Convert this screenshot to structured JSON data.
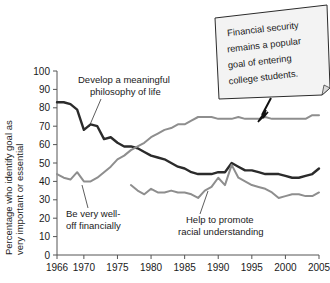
{
  "chart_data": {
    "type": "line",
    "title": "",
    "xlabel": "",
    "ylabel": "Percentage who identify goal as very important or essential",
    "xlim": [
      1966,
      2005
    ],
    "ylim": [
      0,
      100
    ],
    "grid": false,
    "legend_position": "inline-annotations",
    "xticks": [
      "1966",
      "1970",
      "1975",
      "1980",
      "1985",
      "1990",
      "1995",
      "2000",
      "2005"
    ],
    "xtick_values": [
      1966,
      1970,
      1975,
      1980,
      1985,
      1990,
      1995,
      2000,
      2005
    ],
    "yticks": [
      "0",
      "10",
      "20",
      "30",
      "40",
      "50",
      "60",
      "70",
      "80",
      "90",
      "100"
    ],
    "ytick_values": [
      0,
      10,
      20,
      30,
      40,
      50,
      60,
      70,
      80,
      90,
      100
    ],
    "annotations": [
      {
        "id": "callout",
        "text": "Financial security remains a popular goal of entering college students.",
        "lines": [
          "Financial security",
          "remains a popular",
          "goal of entering",
          "college students."
        ],
        "style": "sticky-note-with-arrow"
      }
    ],
    "series": [
      {
        "name": "Develop a meaningful philosophy of life",
        "label_lines": [
          "Develop a meaningful",
          "philosophy of life"
        ],
        "color": "#2b2b2b",
        "x": [
          1966,
          1967,
          1968,
          1969,
          1970,
          1971,
          1972,
          1973,
          1974,
          1975,
          1976,
          1977,
          1978,
          1979,
          1980,
          1981,
          1982,
          1983,
          1984,
          1985,
          1986,
          1987,
          1988,
          1989,
          1990,
          1991,
          1992,
          1993,
          1994,
          1995,
          1996,
          1997,
          1998,
          1999,
          2000,
          2001,
          2002,
          2003,
          2004,
          2005
        ],
        "values": [
          83,
          83,
          82,
          79,
          68,
          71,
          70,
          63,
          64,
          61,
          59,
          59,
          58,
          56,
          54,
          53,
          52,
          50,
          48,
          47,
          45,
          44,
          44,
          44,
          45,
          45,
          50,
          48,
          46,
          46,
          45,
          44,
          44,
          44,
          43,
          42,
          42,
          43,
          44,
          47
        ]
      },
      {
        "name": "Be very well-off financially",
        "label_lines": [
          "Be very well-",
          "off financially"
        ],
        "color": "#8e8e8e",
        "x": [
          1966,
          1967,
          1968,
          1969,
          1970,
          1971,
          1972,
          1973,
          1974,
          1975,
          1976,
          1977,
          1978,
          1979,
          1980,
          1981,
          1982,
          1983,
          1984,
          1985,
          1986,
          1987,
          1988,
          1989,
          1990,
          1991,
          1992,
          1993,
          1994,
          1995,
          1996,
          1997,
          1998,
          1999,
          2000,
          2001,
          2002,
          2003,
          2004,
          2005
        ],
        "values": [
          44,
          42,
          41,
          45,
          40,
          40,
          42,
          45,
          48,
          52,
          54,
          57,
          59,
          61,
          64,
          66,
          68,
          69,
          71,
          71,
          73,
          75,
          75,
          75,
          74,
          74,
          74,
          75,
          74,
          74,
          74,
          75,
          74,
          74,
          74,
          74,
          74,
          74,
          76,
          76
        ]
      },
      {
        "name": "Help to promote racial understanding",
        "label_lines": [
          "Help to promote",
          "racial understanding"
        ],
        "color": "#8e8e8e",
        "x": [
          1977,
          1978,
          1979,
          1980,
          1981,
          1982,
          1983,
          1984,
          1985,
          1986,
          1987,
          1988,
          1989,
          1990,
          1991,
          1992,
          1993,
          1994,
          1995,
          1996,
          1997,
          1998,
          1999,
          2000,
          2001,
          2002,
          2003,
          2004,
          2005
        ],
        "values": [
          38,
          35,
          33,
          36,
          34,
          34,
          35,
          34,
          34,
          33,
          31,
          35,
          37,
          42,
          38,
          49,
          42,
          40,
          38,
          37,
          36,
          34,
          31,
          32,
          33,
          33,
          32,
          32,
          34
        ]
      }
    ]
  },
  "labels": {
    "y_axis": "Percentage who identify goal as very important or essential",
    "y_axis_line1": "Percentage who identify goal as",
    "y_axis_line2": "very important or essential"
  }
}
